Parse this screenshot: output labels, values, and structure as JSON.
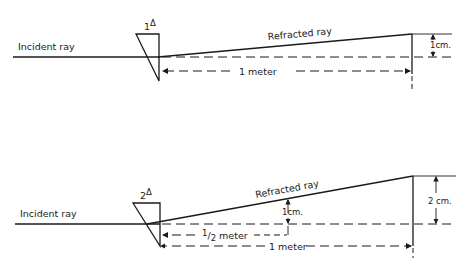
{
  "top_figure": {
    "prism_power": "1",
    "prism_unit": "Δ",
    "incident_label": "Incident ray",
    "refracted_label": "Refracted ray",
    "distance_label": "1 meter",
    "deviation_label": "1cm."
  },
  "bottom_figure": {
    "prism_power": "2",
    "prism_unit": "Δ",
    "incident_label": "Incident ray",
    "refracted_label": "Refracted ray",
    "half_distance_label_num": "1",
    "half_distance_label_den": "2",
    "half_distance_label_unit": " meter",
    "half_deviation_label": "1cm.",
    "distance_label": "1 meter",
    "deviation_label": "2 cm."
  },
  "colors": {
    "ink": "#1a1a1a",
    "background": "#ffffff"
  }
}
